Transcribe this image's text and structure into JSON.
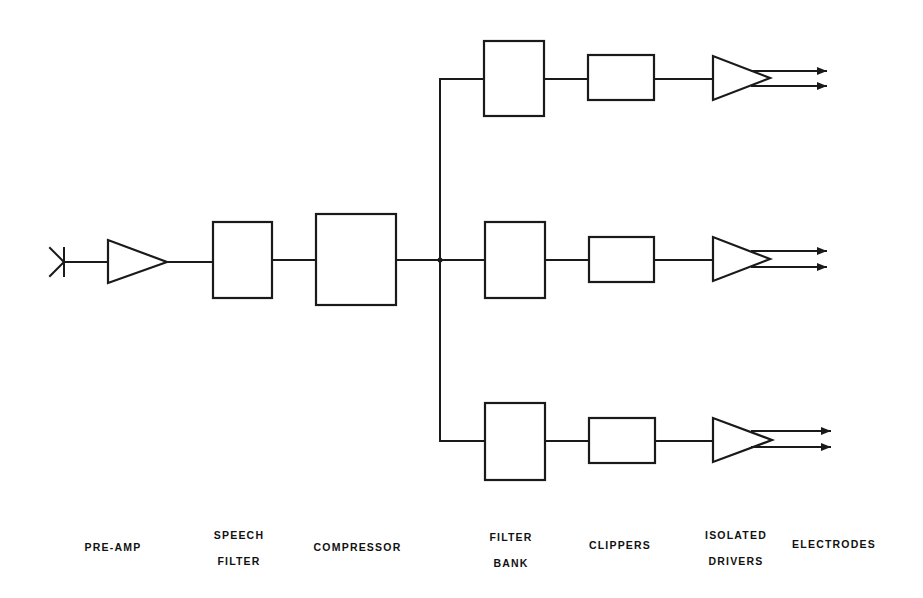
{
  "diagram": {
    "type": "block-diagram",
    "blocks": [
      {
        "id": "input",
        "shape": "antenna-input"
      },
      {
        "id": "pre-amp",
        "shape": "amplifier-triangle"
      },
      {
        "id": "speech-filter",
        "shape": "box"
      },
      {
        "id": "compressor",
        "shape": "box"
      },
      {
        "id": "filter-bank-1",
        "shape": "box"
      },
      {
        "id": "filter-bank-2",
        "shape": "box"
      },
      {
        "id": "filter-bank-3",
        "shape": "box"
      },
      {
        "id": "clipper-1",
        "shape": "box"
      },
      {
        "id": "clipper-2",
        "shape": "box"
      },
      {
        "id": "clipper-3",
        "shape": "box"
      },
      {
        "id": "driver-1",
        "shape": "amplifier-triangle"
      },
      {
        "id": "driver-2",
        "shape": "amplifier-triangle"
      },
      {
        "id": "driver-3",
        "shape": "amplifier-triangle"
      }
    ],
    "channels": 3,
    "outputs_per_channel": 2
  },
  "labels": {
    "pre_amp": [
      "PRE-AMP"
    ],
    "speech_filter": [
      "SPEECH",
      "FILTER"
    ],
    "compressor": [
      "COMPRESSOR"
    ],
    "filter_bank": [
      "FILTER",
      "BANK"
    ],
    "clippers": [
      "CLIPPERS"
    ],
    "isolated_drivers": [
      "ISOLATED",
      "DRIVERS"
    ],
    "electrodes": [
      "ELECTRODES"
    ]
  }
}
